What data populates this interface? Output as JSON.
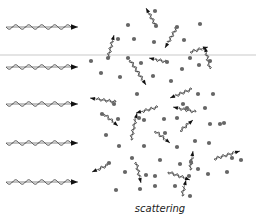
{
  "caption": "scattering",
  "colors": {
    "wave": "#333333",
    "particle": "#666666",
    "band": "#e4e4e4",
    "background": "#ffffff"
  },
  "incident_waves": [
    {
      "x1": 6,
      "x2": 78,
      "y": 27
    },
    {
      "x1": 6,
      "x2": 78,
      "y": 67
    },
    {
      "x1": 6,
      "x2": 78,
      "y": 104
    },
    {
      "x1": 6,
      "x2": 78,
      "y": 143
    },
    {
      "x1": 6,
      "x2": 78,
      "y": 182
    }
  ],
  "particles": [
    [
      155,
      11
    ],
    [
      128,
      25
    ],
    [
      156,
      26
    ],
    [
      177,
      27
    ],
    [
      200,
      24
    ],
    [
      118,
      39
    ],
    [
      134,
      39
    ],
    [
      154,
      42
    ],
    [
      184,
      40
    ],
    [
      91,
      61
    ],
    [
      108,
      58
    ],
    [
      128,
      58
    ],
    [
      141,
      63
    ],
    [
      167,
      62
    ],
    [
      190,
      58
    ],
    [
      182,
      69
    ],
    [
      199,
      65
    ],
    [
      210,
      61
    ],
    [
      101,
      73
    ],
    [
      120,
      77
    ],
    [
      153,
      76
    ],
    [
      171,
      81
    ],
    [
      198,
      94
    ],
    [
      213,
      94
    ],
    [
      137,
      94
    ],
    [
      114,
      104
    ],
    [
      183,
      104
    ],
    [
      102,
      114
    ],
    [
      118,
      119
    ],
    [
      139,
      118
    ],
    [
      144,
      120
    ],
    [
      164,
      119
    ],
    [
      177,
      118
    ],
    [
      187,
      108
    ],
    [
      205,
      108
    ],
    [
      210,
      124
    ],
    [
      224,
      123
    ],
    [
      106,
      135
    ],
    [
      119,
      146
    ],
    [
      144,
      146
    ],
    [
      165,
      133
    ],
    [
      177,
      147
    ],
    [
      195,
      141
    ],
    [
      209,
      143
    ],
    [
      220,
      124
    ],
    [
      132,
      158
    ],
    [
      160,
      160
    ],
    [
      191,
      162
    ],
    [
      232,
      158
    ],
    [
      109,
      163
    ],
    [
      155,
      176
    ],
    [
      125,
      172
    ],
    [
      146,
      175
    ],
    [
      189,
      176
    ],
    [
      198,
      169
    ],
    [
      208,
      174
    ],
    [
      241,
      160
    ],
    [
      116,
      190
    ],
    [
      140,
      189
    ],
    [
      155,
      186
    ],
    [
      175,
      186
    ],
    [
      190,
      196
    ],
    [
      180,
      164
    ],
    [
      227,
      172
    ]
  ],
  "scattered_waves": [
    {
      "x1": 156,
      "y1": 26,
      "x2": 146,
      "y2": 8
    },
    {
      "x1": 108,
      "y1": 58,
      "x2": 114,
      "y2": 35
    },
    {
      "x1": 177,
      "y1": 27,
      "x2": 165,
      "y2": 48
    },
    {
      "x1": 190,
      "y1": 52,
      "x2": 208,
      "y2": 47
    },
    {
      "x1": 210,
      "y1": 69,
      "x2": 205,
      "y2": 47
    },
    {
      "x1": 167,
      "y1": 62,
      "x2": 149,
      "y2": 58
    },
    {
      "x1": 130,
      "y1": 60,
      "x2": 146,
      "y2": 85
    },
    {
      "x1": 116,
      "y1": 102,
      "x2": 90,
      "y2": 98
    },
    {
      "x1": 104,
      "y1": 114,
      "x2": 118,
      "y2": 126
    },
    {
      "x1": 158,
      "y1": 107,
      "x2": 136,
      "y2": 113
    },
    {
      "x1": 131,
      "y1": 140,
      "x2": 137,
      "y2": 113
    },
    {
      "x1": 192,
      "y1": 89,
      "x2": 170,
      "y2": 98
    },
    {
      "x1": 196,
      "y1": 112,
      "x2": 173,
      "y2": 107
    },
    {
      "x1": 180,
      "y1": 131,
      "x2": 193,
      "y2": 120
    },
    {
      "x1": 155,
      "y1": 131,
      "x2": 170,
      "y2": 143
    },
    {
      "x1": 190,
      "y1": 170,
      "x2": 193,
      "y2": 151
    },
    {
      "x1": 214,
      "y1": 159,
      "x2": 240,
      "y2": 151
    },
    {
      "x1": 108,
      "y1": 165,
      "x2": 92,
      "y2": 172
    },
    {
      "x1": 136,
      "y1": 162,
      "x2": 141,
      "y2": 183
    },
    {
      "x1": 168,
      "y1": 172,
      "x2": 190,
      "y2": 180
    },
    {
      "x1": 182,
      "y1": 196,
      "x2": 186,
      "y2": 180
    }
  ]
}
